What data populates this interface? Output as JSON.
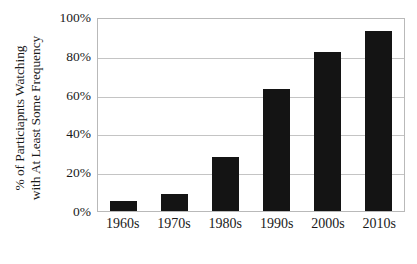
{
  "chart_data": {
    "type": "bar",
    "title": "",
    "xlabel": "",
    "ylabel": "% of Particiapnts Watching with At Least Some Frequency",
    "ylabel_lines": [
      "% of Particiapnts Watching",
      "with At Least Some Frequency"
    ],
    "categories": [
      "1960s",
      "1970s",
      "1980s",
      "1990s",
      "2000s",
      "2010s"
    ],
    "values": [
      5,
      9,
      28,
      63,
      82,
      93
    ],
    "value_labels": [
      "5%",
      "9%",
      "28%",
      "63%",
      "82%",
      "93%"
    ],
    "ylim": [
      0,
      100
    ],
    "ytick_values": [
      0,
      20,
      40,
      60,
      80,
      100
    ],
    "ytick_labels": [
      "0%",
      "20%",
      "40%",
      "60%",
      "80%",
      "100%"
    ],
    "grid": "horizontal",
    "legend": "none",
    "bar_color": "#141414",
    "gridline_color": "#c4c4c4",
    "plot_border_color": "#b9b9b9",
    "background_color": "#ffffff",
    "text_color": "#1a1a1a"
  }
}
